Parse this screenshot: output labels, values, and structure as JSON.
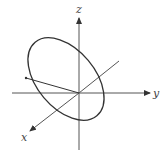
{
  "diagram": {
    "type": "3d-coordinate-axes-with-ellipse",
    "axes": [
      {
        "name": "z",
        "label": "z"
      },
      {
        "name": "y",
        "label": "y"
      },
      {
        "name": "x",
        "label": "x"
      }
    ],
    "shapes": [
      {
        "name": "tilted-circle",
        "description": "circle in 3D drawn as rotated ellipse centered at origin"
      },
      {
        "name": "radius-line",
        "description": "segment from origin to point on circle"
      }
    ],
    "colors": {
      "stroke": "#333333",
      "axis": "#555555",
      "background": "#ffffff"
    }
  }
}
